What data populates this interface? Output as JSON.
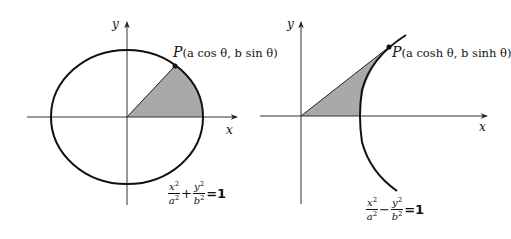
{
  "figures": [
    {
      "id": "ellipse",
      "axis_labels": {
        "x": "x",
        "y": "y"
      },
      "point_label": {
        "name": "P",
        "coords": "(a cos θ, b sin θ)",
        "x_expr": "a cos θ",
        "y_expr": "b sin θ"
      },
      "equation": {
        "term1_num": "x",
        "term1_den": "a",
        "operator": "+",
        "term2_num": "y",
        "term2_den": "b",
        "exponent": "2",
        "rhs": "=1",
        "text": "x²/a² + y²/b² = 1"
      },
      "shaded_region": "sector from origin to P along ellipse arc to positive x-axis"
    },
    {
      "id": "hyperbola",
      "axis_labels": {
        "x": "x",
        "y": "y"
      },
      "point_label": {
        "name": "P",
        "coords": "(a cosh θ, b sinh θ)",
        "x_expr": "a cosh θ",
        "y_expr": "b sinh θ"
      },
      "equation": {
        "term1_num": "x",
        "term1_den": "a",
        "operator": "−",
        "term2_num": "y",
        "term2_den": "b",
        "exponent": "2",
        "rhs": "=1",
        "text": "x²/a² − y²/b² = 1"
      },
      "shaded_region": "region bounded by line OP, hyperbola arc and positive x-axis"
    }
  ],
  "colors": {
    "stroke": "#111111",
    "shade": "#a9a9a9",
    "axis": "#333333",
    "background": "#ffffff"
  }
}
